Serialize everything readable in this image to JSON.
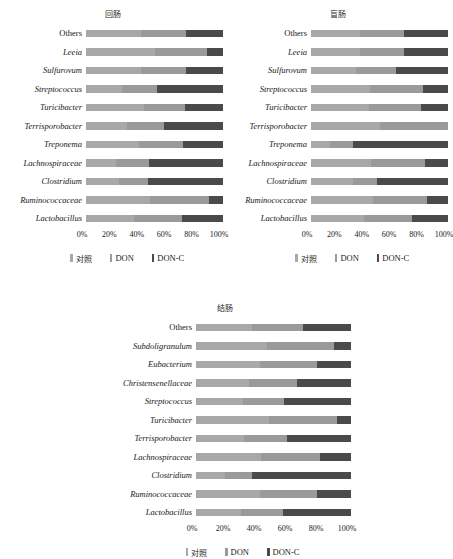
{
  "legend": {
    "series": [
      {
        "name": "对照",
        "color": "#a8a8a8"
      },
      {
        "name": "DON",
        "color": "#9a9a9a"
      },
      {
        "name": "DON-C",
        "color": "#4a4a4a"
      }
    ]
  },
  "axis": {
    "ticks": [
      "0%",
      "20%",
      "40%",
      "60%",
      "80%",
      "100%"
    ],
    "values": [
      0,
      20,
      40,
      60,
      80,
      100
    ]
  },
  "charts": [
    {
      "id": "ileum",
      "title": "回肠",
      "categories": [
        "Others",
        "Leeia",
        "Sulfurovum",
        "Streptococcus",
        "Turicibacter",
        "Terrisporobacter",
        "Treponema",
        "Lachnospiraceae",
        "Clostridium",
        "Ruminococcaceae",
        "Lactobacillus"
      ]
    },
    {
      "id": "cecum",
      "title": "盲肠",
      "categories": [
        "Others",
        "Leeia",
        "Sulfurovum",
        "Streptococcus",
        "Turicibacter",
        "Terrisporobacter",
        "Treponema",
        "Lachnospiraceae",
        "Clostridium",
        "Ruminococcaceae",
        "Lactobacillus"
      ]
    },
    {
      "id": "colon",
      "title": "结肠",
      "categories": [
        "Others",
        "Subdoligranulum",
        "Eubacterium",
        "Christensenellaceae",
        "Streptococcus",
        "Turicibacter",
        "Terrisporobacter",
        "Lachnospiraceae",
        "Clostridium",
        "Ruminococcaceae",
        "Lactobacillus"
      ]
    }
  ],
  "chart_data": [
    {
      "type": "bar",
      "orientation": "horizontal",
      "stacked": true,
      "normalized_percent": true,
      "title": "回肠",
      "xlabel": "",
      "ylabel": "",
      "xlim": [
        0,
        100
      ],
      "grid": false,
      "legend_position": "bottom",
      "categories": [
        "Others",
        "Leeia",
        "Sulfurovum",
        "Streptococcus",
        "Turicibacter",
        "Terrisporobacter",
        "Treponema",
        "Lachnospiraceae",
        "Clostridium",
        "Ruminococcaceae",
        "Lactobacillus"
      ],
      "series": [
        {
          "name": "对照",
          "values": [
            40,
            50,
            40,
            26,
            42,
            30,
            39,
            22,
            24,
            47,
            35
          ]
        },
        {
          "name": "DON",
          "values": [
            33,
            38,
            33,
            26,
            30,
            27,
            32,
            24,
            21,
            43,
            35
          ]
        },
        {
          "name": "DON-C",
          "values": [
            27,
            12,
            27,
            48,
            28,
            43,
            29,
            54,
            55,
            10,
            30
          ]
        }
      ]
    },
    {
      "type": "bar",
      "orientation": "horizontal",
      "stacked": true,
      "normalized_percent": true,
      "title": "盲肠",
      "xlabel": "",
      "ylabel": "",
      "xlim": [
        0,
        100
      ],
      "grid": false,
      "legend_position": "bottom",
      "categories": [
        "Others",
        "Leeia",
        "Sulfurovum",
        "Streptococcus",
        "Turicibacter",
        "Terrisporobacter",
        "Treponema",
        "Lachnospiraceae",
        "Clostridium",
        "Ruminococcaceae",
        "Lactobacillus"
      ],
      "series": [
        {
          "name": "对照",
          "values": [
            36,
            36,
            33,
            43,
            42,
            50,
            14,
            44,
            31,
            45,
            39
          ]
        },
        {
          "name": "DON",
          "values": [
            32,
            32,
            29,
            39,
            38,
            50,
            17,
            39,
            17,
            40,
            35
          ]
        },
        {
          "name": "DON-C",
          "values": [
            32,
            32,
            38,
            18,
            20,
            0,
            69,
            17,
            52,
            15,
            26
          ]
        }
      ]
    },
    {
      "type": "bar",
      "orientation": "horizontal",
      "stacked": true,
      "normalized_percent": true,
      "title": "结肠",
      "xlabel": "",
      "ylabel": "",
      "xlim": [
        0,
        100
      ],
      "grid": false,
      "legend_position": "bottom",
      "categories": [
        "Others",
        "Subdoligranulum",
        "Eubacterium",
        "Christensenellaceae",
        "Streptococcus",
        "Turicibacter",
        "Terrisporobacter",
        "Lachnospiraceae",
        "Clostridium",
        "Ruminococcaceae",
        "Lactobacillus"
      ],
      "series": [
        {
          "name": "对照",
          "values": [
            36,
            46,
            41,
            34,
            30,
            47,
            31,
            42,
            19,
            41,
            29
          ]
        },
        {
          "name": "DON",
          "values": [
            33,
            43,
            37,
            31,
            27,
            44,
            28,
            38,
            17,
            37,
            27
          ]
        },
        {
          "name": "DON-C",
          "values": [
            31,
            11,
            22,
            35,
            43,
            9,
            41,
            20,
            64,
            22,
            44
          ]
        }
      ]
    }
  ]
}
